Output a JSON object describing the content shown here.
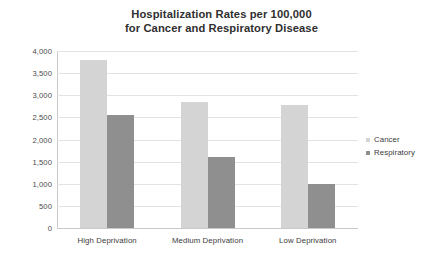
{
  "chart_data": {
    "type": "bar",
    "title": "Hospitalization Rates per 100,000 for Cancer and Respiratory Disease",
    "title_line1": "Hospitalization Rates per 100,000",
    "title_line2": "for Cancer and Respiratory Disease",
    "categories": [
      "High Deprivation",
      "Medium Deprivation",
      "Low Deprivation"
    ],
    "series": [
      {
        "name": "Cancer",
        "color": "#d4d4d4",
        "values": [
          3800,
          2850,
          2780
        ]
      },
      {
        "name": "Respiratory",
        "color": "#8f8f8f",
        "values": [
          2560,
          1600,
          1000
        ]
      }
    ],
    "xlabel": "",
    "ylabel": "",
    "ylim": [
      0,
      4000
    ],
    "ytick_values": [
      4000,
      3500,
      3000,
      2500,
      2000,
      1500,
      1000,
      500,
      0
    ],
    "ytick_labels": [
      "4,000",
      "3,500",
      "3,000",
      "2,500",
      "2,000",
      "1,500",
      "1,000",
      "500",
      "0"
    ],
    "grid": true,
    "legend_position": "right",
    "legend": [
      "Cancer",
      "Respiratory"
    ]
  }
}
